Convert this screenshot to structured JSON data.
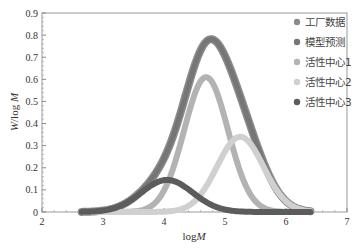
{
  "chart_data": {
    "type": "line",
    "title": "",
    "xlabel": "logM",
    "ylabel": "W/log M",
    "xlim": [
      2,
      7
    ],
    "ylim": [
      0,
      0.9
    ],
    "xticks": [
      2,
      3,
      4,
      5,
      6,
      7
    ],
    "yticks": [
      0,
      0.1,
      0.2,
      0.3,
      0.4,
      0.5,
      0.6,
      0.7,
      0.8,
      0.9
    ],
    "ytick_labels": [
      "0",
      "0.1",
      "0.2",
      "0.3",
      "0.4",
      "0.5",
      "0.6",
      "0.7",
      "0.8",
      "0.9"
    ],
    "grid": false,
    "legend_position": "upper right",
    "x_range_curves": [
      2.65,
      6.4
    ],
    "series": [
      {
        "name": "工厂数据",
        "kind": "sum",
        "color": "#8c8c8c",
        "width": 8
      },
      {
        "name": "模型预测",
        "kind": "sum",
        "color": "#767676",
        "width": 5
      },
      {
        "name": "活性中心1",
        "kind": "gaussian",
        "peak_x": 4.69,
        "peak_y": 0.61,
        "sigma": 0.36,
        "color": "#b3b3b3",
        "width": 6
      },
      {
        "name": "活性中心2",
        "kind": "gaussian",
        "peak_x": 5.25,
        "peak_y": 0.34,
        "sigma": 0.38,
        "color": "#d0d0d0",
        "width": 6
      },
      {
        "name": "活性中心3",
        "kind": "gaussian",
        "peak_x": 4.05,
        "peak_y": 0.145,
        "sigma": 0.42,
        "color": "#5c5c5c",
        "width": 6
      }
    ],
    "peaks": [
      {
        "series": "模型预测",
        "x": 4.79,
        "y": 0.78
      },
      {
        "series": "活性中心1",
        "x": 4.69,
        "y": 0.61
      },
      {
        "series": "活性中心2",
        "x": 5.25,
        "y": 0.34
      },
      {
        "series": "活性中心3",
        "x": 4.05,
        "y": 0.145
      }
    ]
  },
  "legend": {
    "items": [
      {
        "label": "工厂数据",
        "color": "#8c8c8c"
      },
      {
        "label": "模型预测",
        "color": "#767676"
      },
      {
        "label": "活性中心1",
        "color": "#b3b3b3"
      },
      {
        "label": "活性中心2",
        "color": "#d0d0d0"
      },
      {
        "label": "活性中心3",
        "color": "#5c5c5c"
      }
    ]
  },
  "axes": {
    "xlabel_prefix": "log",
    "xlabel_italic": "M",
    "ylabel_italic_w": "W",
    "ylabel_mid": "/log ",
    "ylabel_italic_m": "M"
  }
}
